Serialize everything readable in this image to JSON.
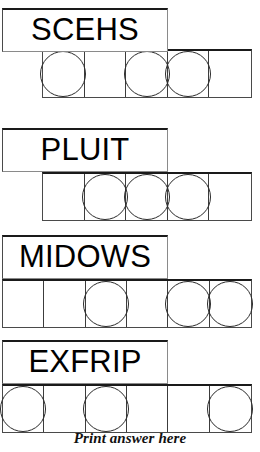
{
  "puzzle_sheet": {
    "caption": "Print answer here",
    "cell_count_note": "",
    "colors": {
      "ink": "#000000",
      "line": "#3c3c3c",
      "line_heavy": "#1a1a1a",
      "paper": "#ffffff"
    },
    "items": [
      {
        "id": "puzzle-1",
        "scrambled_word": "SCEHS",
        "cells": 5,
        "circled_cells": [
          1,
          3,
          4
        ],
        "cell_marks": [
          "circle",
          "",
          "circle",
          "circle",
          ""
        ]
      },
      {
        "id": "puzzle-2",
        "scrambled_word": "PLUIT",
        "cells": 5,
        "circled_cells": [
          2,
          3,
          4
        ],
        "cell_marks": [
          "",
          "circle",
          "circle",
          "circle",
          ""
        ]
      },
      {
        "id": "puzzle-3",
        "scrambled_word": "MIDOWS",
        "cells": 6,
        "circled_cells": [
          3,
          5,
          6
        ],
        "cell_marks": [
          "",
          "",
          "circle",
          "",
          "circle",
          "circle"
        ]
      },
      {
        "id": "puzzle-4",
        "scrambled_word": "EXFRIP",
        "cells": 6,
        "circled_cells": [
          1,
          3,
          6
        ],
        "cell_marks": [
          "circle",
          "",
          "circle",
          "",
          "",
          "circle"
        ]
      }
    ]
  }
}
